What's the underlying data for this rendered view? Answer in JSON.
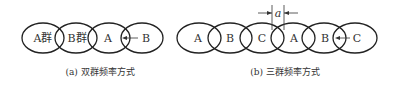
{
  "figure": {
    "panel_a": {
      "caption": "(a)  双群频率方式",
      "ellipses": [
        "A群",
        "B群",
        "A",
        "B"
      ],
      "arrow_note": "arrow pointing from B toward overlap of A and B"
    },
    "panel_b": {
      "caption": "(b)  三群频率方式",
      "ellipses": [
        "A",
        "B",
        "C",
        "A",
        "B",
        "C"
      ],
      "dimension_label": "a"
    }
  }
}
